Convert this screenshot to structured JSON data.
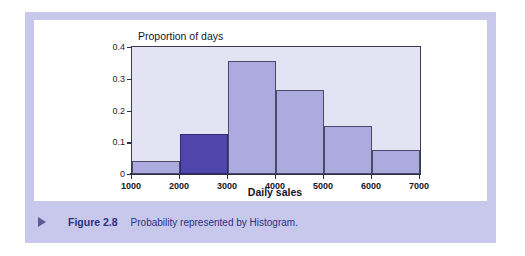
{
  "figure": {
    "caption_marker": "triangle-right",
    "caption_number": "Figure 2.8",
    "caption_text": "Probability represented by Histogram."
  },
  "colors": {
    "panel_background": "#c7c8ec",
    "chart_background": "#ffffff",
    "plot_background": "#e3e3f3",
    "bar_fill": "#acaade",
    "bar_highlight_fill": "#4f45ab",
    "bar_stroke": "#4a4a66",
    "axis": "#2f2f48",
    "caption_text": "#2e2f7e"
  },
  "chart_data": {
    "type": "bar",
    "title": "",
    "subtitle": "",
    "xlabel": "Daily sales",
    "ylabel": "Proportion of days",
    "xlim": [
      1000,
      7000
    ],
    "ylim": [
      0,
      0.4
    ],
    "grid": false,
    "legend": null,
    "bin_width": 1000,
    "x_ticks": [
      1000,
      2000,
      3000,
      4000,
      5000,
      6000,
      7000
    ],
    "x_tick_labels": [
      "1000",
      "2000",
      "3000",
      "4000",
      "5000",
      "6000",
      "7000"
    ],
    "y_ticks": [
      0,
      0.1,
      0.2,
      0.3,
      0.4
    ],
    "y_tick_labels": [
      "0",
      "0.1",
      "0.2",
      "0.3",
      "0.4"
    ],
    "categories": [
      "1000-2000",
      "2000-3000",
      "3000-4000",
      "4000-5000",
      "5000-6000",
      "6000-7000"
    ],
    "bins": [
      {
        "label": "1000-2000",
        "start": 1000,
        "end": 2000,
        "value": 0.04,
        "highlighted": false
      },
      {
        "label": "2000-3000",
        "start": 2000,
        "end": 3000,
        "value": 0.125,
        "highlighted": true
      },
      {
        "label": "3000-4000",
        "start": 3000,
        "end": 4000,
        "value": 0.355,
        "highlighted": false
      },
      {
        "label": "4000-5000",
        "start": 4000,
        "end": 5000,
        "value": 0.265,
        "highlighted": false
      },
      {
        "label": "5000-6000",
        "start": 5000,
        "end": 6000,
        "value": 0.15,
        "highlighted": false
      },
      {
        "label": "6000-7000",
        "start": 6000,
        "end": 7000,
        "value": 0.075,
        "highlighted": false
      }
    ],
    "values": [
      0.04,
      0.125,
      0.355,
      0.265,
      0.15,
      0.075
    ]
  }
}
